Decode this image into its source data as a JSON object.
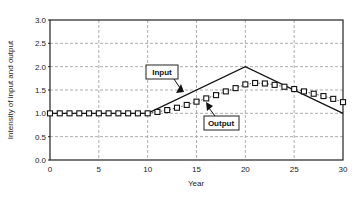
{
  "chart_data": {
    "type": "line",
    "title": "",
    "xlabel": "Year",
    "ylabel": "Intensity of input and output",
    "xlim": [
      0,
      30
    ],
    "ylim": [
      0,
      3.0
    ],
    "x_ticks": [
      "0",
      "5",
      "10",
      "15",
      "20",
      "25",
      "30"
    ],
    "y_ticks": [
      "0.0",
      "0.5",
      "1.0",
      "1.5",
      "2.0",
      "2.5",
      "3.0"
    ],
    "grid": true,
    "legend": "none",
    "series": [
      {
        "name": "Input",
        "style": "solid line",
        "x": [
          0,
          10,
          20,
          30
        ],
        "values": [
          1.0,
          1.0,
          2.0,
          1.0
        ]
      },
      {
        "name": "Output",
        "style": "dotted line with square markers",
        "x": [
          0,
          1,
          2,
          3,
          4,
          5,
          6,
          7,
          8,
          9,
          10,
          11,
          12,
          13,
          14,
          15,
          16,
          17,
          18,
          19,
          20,
          21,
          22,
          23,
          24,
          25,
          26,
          27,
          28,
          29,
          30
        ],
        "values": [
          1.0,
          1.0,
          1.0,
          1.0,
          1.0,
          1.0,
          1.0,
          1.0,
          1.0,
          1.0,
          1.0,
          1.03,
          1.07,
          1.12,
          1.18,
          1.25,
          1.32,
          1.39,
          1.47,
          1.54,
          1.62,
          1.65,
          1.64,
          1.61,
          1.57,
          1.52,
          1.47,
          1.42,
          1.37,
          1.31,
          1.24
        ]
      }
    ],
    "annotations": [
      {
        "text": "Input",
        "points_to": "Input line near year 13"
      },
      {
        "text": "Output",
        "points_to": "Output markers near year 16"
      }
    ]
  }
}
